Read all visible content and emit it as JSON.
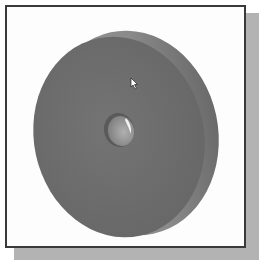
{
  "viewport": {
    "description": "3D CAD model view of a solid disc (wheel) with center hole",
    "background_color": "#fdfdfd",
    "frame_color": "#3a3a3a",
    "shadow_color": "#b3b3b3"
  },
  "model": {
    "name": "disc-with-center-hole",
    "face_color": "#6e6e6e",
    "rim_color": "#8a8a8a",
    "hole_color": "#9a9a9a",
    "highlight_color": "#f2f2f2"
  },
  "cursor": {
    "icon": "arrow-pointer-icon",
    "x": 131,
    "y": 78
  }
}
